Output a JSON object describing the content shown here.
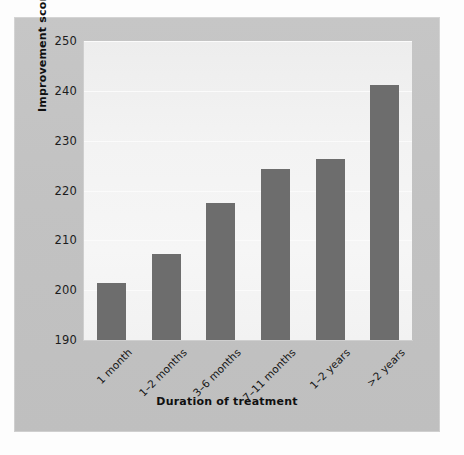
{
  "chart_data": {
    "type": "bar",
    "title": "",
    "xlabel": "Duration of treatment",
    "ylabel": "Improvement score",
    "categories": [
      "1 month",
      "1–2 months",
      "3–6 months",
      "7–11 months",
      "1–2 years",
      ">2 years"
    ],
    "values": [
      201.4,
      207.3,
      217.4,
      224.3,
      226.3,
      241.2
    ],
    "ylim": [
      190,
      250
    ],
    "yticks": [
      190,
      200,
      210,
      220,
      230,
      240,
      250
    ],
    "ytick_labels": [
      "190",
      "200",
      "210",
      "220",
      "230",
      "240",
      "250"
    ],
    "grid": "horizontal",
    "legend": "none",
    "bar_color": "#6d6d6d",
    "plot_background": "#f3f3f3",
    "panel_background": "#c3c3c3"
  },
  "axes": {
    "x_title": "Duration of treatment",
    "y_title": "Improvement score"
  }
}
